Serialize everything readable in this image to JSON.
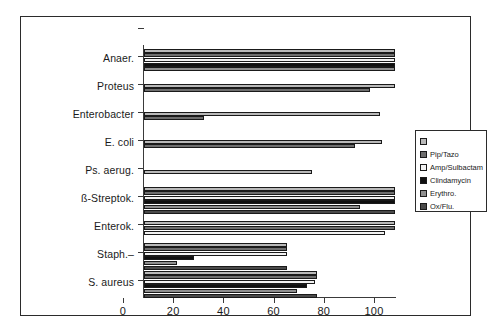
{
  "chart_data": {
    "type": "bar",
    "orientation": "horizontal",
    "title": "",
    "subtitle": "",
    "xlabel": "",
    "ylabel": "",
    "xlim": [
      0,
      100
    ],
    "xticks": [
      0,
      20,
      40,
      60,
      80,
      100
    ],
    "xtick_labels": [
      "0",
      "20",
      "40",
      "60",
      "80",
      "100"
    ],
    "grid": false,
    "legend_position": "right",
    "categories": [
      "Anaer.",
      "Proteus",
      "Enterobacter",
      "E. coli",
      "Ps. aerug.",
      "ß-Streptok.",
      "Enterok.",
      "Staph.–",
      "S. aureus"
    ],
    "series": [
      {
        "name": "",
        "legend_label": "",
        "color": "#b9b9b9",
        "values": [
          100,
          100,
          94,
          95,
          67,
          100,
          100,
          57,
          69
        ]
      },
      {
        "name": "Pip/Tazo",
        "legend_label": "Pip/Tazo",
        "color": "#6e6e6e",
        "values": [
          100,
          90,
          24,
          84,
          null,
          100,
          100,
          57,
          69
        ]
      },
      {
        "name": "Amp/Sulbactam",
        "legend_label": "Amp/Sulbactam",
        "color": "#f2f2f2",
        "values": [
          100,
          null,
          null,
          null,
          null,
          100,
          96,
          57,
          68
        ]
      },
      {
        "name": "Clindamycin",
        "legend_label": "Clindamycin",
        "color": "#101010",
        "values": [
          100,
          null,
          null,
          null,
          null,
          100,
          null,
          20,
          65
        ]
      },
      {
        "name": "Erythro.",
        "legend_label": "Erythro.",
        "color": "#8f8f8f",
        "values": [
          100,
          null,
          null,
          null,
          null,
          86,
          null,
          13,
          61
        ]
      },
      {
        "name": "Ox/Flu.",
        "legend_label": "Ox/Flu.",
        "color": "#4a4a4a",
        "values": [
          null,
          null,
          null,
          null,
          null,
          100,
          null,
          57,
          69
        ]
      }
    ]
  },
  "legend": {
    "entries": [
      {
        "label": "",
        "color": "#b9b9b9"
      },
      {
        "label": "Pip/Tazo",
        "color": "#6e6e6e"
      },
      {
        "label": "Amp/Sulbactam",
        "color": "#f2f2f2"
      },
      {
        "label": "Clindamycin",
        "color": "#101010"
      },
      {
        "label": "Erythro.",
        "color": "#8f8f8f"
      },
      {
        "label": "Ox/Flu.",
        "color": "#4a4a4a"
      }
    ]
  },
  "colors": {
    "axis": "#3a3a3a",
    "frame": "#2b2b2b",
    "background": "#ffffff",
    "text": "#1a1a1a"
  }
}
